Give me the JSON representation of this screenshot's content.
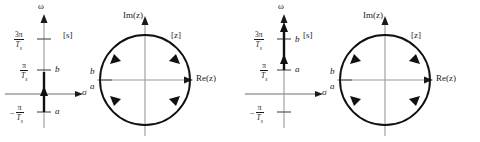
{
  "figure": {
    "background_color": "#ffffff",
    "ink_color": "#1a1a1a",
    "axis_color": "#8c8c8c"
  },
  "panels": [
    {
      "id": "panel-left",
      "splane": {
        "plane_label": "[s]",
        "vertical_axis_label": "ω",
        "horizontal_axis_label": "σ",
        "ticks": [
          {
            "id": "tick-3pi",
            "numerator": "3π",
            "denominator": "T",
            "denominator_sub": "s",
            "sign": "",
            "point_label": ""
          },
          {
            "id": "tick-pi",
            "numerator": "π",
            "denominator": "T",
            "denominator_sub": "s",
            "sign": "",
            "point_label": "b"
          },
          {
            "id": "tick-neg-pi",
            "numerator": "π",
            "denominator": "T",
            "denominator_sub": "s",
            "sign": "−",
            "point_label": "a"
          }
        ],
        "highlighted_segment": {
          "from_label": "a",
          "to_label": "b",
          "from_value": "-π/Ts",
          "to_value": "π/Ts"
        }
      },
      "zplane": {
        "plane_label": "[z]",
        "vertical_axis_label": "Im(z)",
        "horizontal_axis_label": "Re(z)",
        "circle_label_upper": "b",
        "circle_label_lower": "a",
        "direction": "counterclockwise",
        "arrow_count": 4
      }
    },
    {
      "id": "panel-right",
      "splane": {
        "plane_label": "[s]",
        "vertical_axis_label": "ω",
        "horizontal_axis_label": "σ",
        "ticks": [
          {
            "id": "tick-3pi",
            "numerator": "3π",
            "denominator": "T",
            "denominator_sub": "s",
            "sign": "",
            "point_label": "b"
          },
          {
            "id": "tick-pi",
            "numerator": "π",
            "denominator": "T",
            "denominator_sub": "s",
            "sign": "",
            "point_label": "a"
          },
          {
            "id": "tick-neg-pi",
            "numerator": "π",
            "denominator": "T",
            "denominator_sub": "s",
            "sign": "−",
            "point_label": ""
          }
        ],
        "highlighted_segment": {
          "from_label": "a",
          "to_label": "b",
          "from_value": "π/Ts",
          "to_value": "3π/Ts"
        }
      },
      "zplane": {
        "plane_label": "[z]",
        "vertical_axis_label": "Im(z)",
        "horizontal_axis_label": "Re(z)",
        "circle_label_upper": "b",
        "circle_label_lower": "a",
        "direction": "counterclockwise",
        "arrow_count": 4
      }
    }
  ]
}
